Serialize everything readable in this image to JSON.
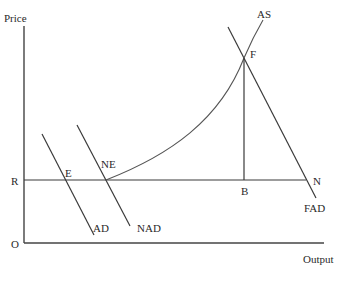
{
  "diagram": {
    "type": "economics-ad-as",
    "axes": {
      "y_label": "Price",
      "x_label": "Output",
      "origin_label": "O"
    },
    "price_level_label": "R",
    "curves": {
      "as": "AS",
      "ad": "AD",
      "nad": "NAD",
      "fad": "FAD"
    },
    "points": {
      "e": "E",
      "ne": "NE",
      "f": "F",
      "b": "B",
      "n": "N"
    },
    "colors": {
      "line": "#3a3a3a",
      "background": "#ffffff"
    }
  }
}
